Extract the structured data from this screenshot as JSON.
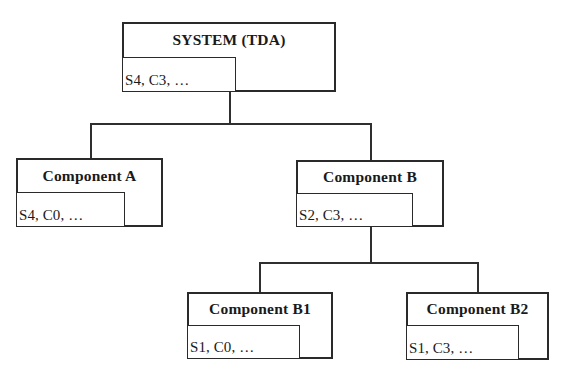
{
  "diagram": {
    "type": "hierarchy-tree",
    "nodes": [
      {
        "id": "system",
        "title": "SYSTEM (TDA)",
        "attributes": "S4, C3, …",
        "parent": null
      },
      {
        "id": "component-a",
        "title": "Component A",
        "attributes": "S4, C0, …",
        "parent": "system"
      },
      {
        "id": "component-b",
        "title": "Component B",
        "attributes": "S2, C3, …",
        "parent": "system"
      },
      {
        "id": "component-b1",
        "title": "Component B1",
        "attributes": "S1, C0, …",
        "parent": "component-b"
      },
      {
        "id": "component-b2",
        "title": "Component B2",
        "attributes": "S1, C3, …",
        "parent": "component-b"
      }
    ],
    "edges": [
      {
        "from": "system",
        "to": "component-a"
      },
      {
        "from": "system",
        "to": "component-b"
      },
      {
        "from": "component-b",
        "to": "component-b1"
      },
      {
        "from": "component-b",
        "to": "component-b2"
      }
    ],
    "colors": {
      "stroke": "#2a2a2a",
      "background": "#ffffff",
      "text": "#1a1a1a"
    }
  }
}
